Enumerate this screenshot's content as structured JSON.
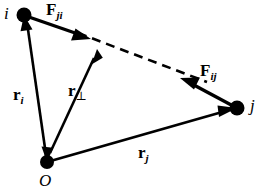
{
  "figure": {
    "background_color": "#ffffff",
    "stroke_color": "#000000",
    "width": 279,
    "height": 195
  },
  "points": {
    "i": {
      "label": "i",
      "x": 24,
      "y": 15,
      "dot_radius": 7
    },
    "j": {
      "label": "j",
      "x": 237,
      "y": 108,
      "dot_radius": 7
    },
    "O": {
      "label": "O",
      "x": 47,
      "y": 162,
      "dot_radius": 7
    }
  },
  "vectors": {
    "F_ji": {
      "symbol": "F",
      "subscript": "ji",
      "from": "i",
      "to_x": 90,
      "to_y": 38,
      "style": "solid",
      "arrowheads": "end"
    },
    "F_ij": {
      "symbol": "F",
      "subscript": "ij",
      "from": "j",
      "to_x": 181,
      "to_y": 79,
      "style": "solid",
      "arrowheads": "end"
    },
    "r_i": {
      "symbol": "r",
      "subscript": "i",
      "from": "O",
      "to": "i",
      "style": "solid",
      "arrowheads": "end"
    },
    "r_j": {
      "symbol": "r",
      "subscript": "j",
      "from": "O",
      "to": "j",
      "style": "solid",
      "arrowheads": "end"
    },
    "r_perp": {
      "symbol": "r",
      "subscript": "⊥",
      "from": "O",
      "to_x": 97,
      "to_y": 49,
      "style": "solid",
      "arrowheads": "both",
      "description": "moment arm, perpendicular distance from O to line of action"
    }
  },
  "line_of_action": {
    "style": "dashed",
    "from_x": 78,
    "from_y": 33,
    "to_x": 205,
    "to_y": 81,
    "dash_pattern": "9 6"
  }
}
